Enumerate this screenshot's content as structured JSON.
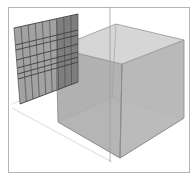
{
  "scene": {
    "description": "3D viewport showing a translucent cube with a gridded panel beside it",
    "frame": {
      "x": 8,
      "y": 7,
      "width": 182,
      "height": 166,
      "color": "#b5b5b5"
    },
    "colors": {
      "background": "#ffffff",
      "cube_top": "#d6d6d6",
      "cube_left_face": "#a9a9a9",
      "cube_right_face": "#b4b4b4",
      "cube_floor": "#d8d8d8",
      "cube_back_left_wall": "#bdbdbd",
      "cube_back_right_wall": "#c6c6c6",
      "edge": "#8c8c8c",
      "panel_fill": "#a2a2a2",
      "panel_overlap": "#7e7e7e",
      "panel_lines": "#4a4a4a",
      "axis_line": "#a0a0a0",
      "ground_line": "#e4e4e4"
    },
    "objects": [
      {
        "name": "cube",
        "type": "translucent-box"
      },
      {
        "name": "grid-panel",
        "type": "gridded-plane",
        "columns": 9
      },
      {
        "name": "vertical-axis",
        "type": "reference-line"
      },
      {
        "name": "ground-plane",
        "type": "guide-line"
      }
    ]
  }
}
